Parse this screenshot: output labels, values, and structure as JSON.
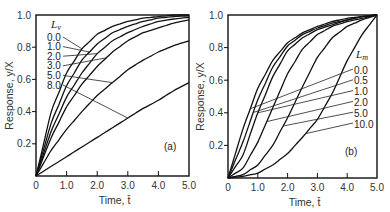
{
  "chart_data": [
    {
      "type": "line",
      "panel_label": "(a)",
      "title": "",
      "xlabel": "Time, t̄",
      "ylabel": "Response, y/X",
      "xlim": [
        0,
        5
      ],
      "ylim": [
        0,
        1
      ],
      "xticks": [
        1.0,
        2.0,
        3.0,
        4.0
      ],
      "xtick_labels": [
        "0",
        "1.0",
        "2.0",
        "3.0",
        "4.0",
        "5.0"
      ],
      "ytick_labels": [
        "0.2",
        "0.4",
        "0.6",
        "0.8",
        "1.0"
      ],
      "yticks": [
        0.2,
        0.4,
        0.6,
        0.8,
        1.0
      ],
      "grid": false,
      "legend_title": "L",
      "legend_title_sub": "v",
      "legend_position": "top-left",
      "x": [
        0,
        0.5,
        1,
        1.5,
        2,
        2.5,
        3,
        3.5,
        4,
        4.5,
        5
      ],
      "series": [
        {
          "name": "0.0",
          "values": [
            0,
            0.4,
            0.64,
            0.79,
            0.88,
            0.93,
            0.96,
            0.98,
            0.99,
            1.0,
            1.0
          ],
          "label_at": 1.5
        },
        {
          "name": "1.0",
          "values": [
            0,
            0.33,
            0.56,
            0.72,
            0.82,
            0.89,
            0.93,
            0.96,
            0.98,
            0.99,
            0.995
          ],
          "label_at": 1.75
        },
        {
          "name": "2.0",
          "values": [
            0,
            0.28,
            0.49,
            0.64,
            0.76,
            0.84,
            0.89,
            0.93,
            0.96,
            0.975,
            0.985
          ],
          "label_at": 2.0
        },
        {
          "name": "3.0",
          "values": [
            0,
            0.24,
            0.43,
            0.57,
            0.68,
            0.77,
            0.84,
            0.89,
            0.92,
            0.95,
            0.97
          ],
          "label_at": 2.3
        },
        {
          "name": "5.0",
          "values": [
            0,
            0.16,
            0.29,
            0.4,
            0.5,
            0.58,
            0.66,
            0.72,
            0.77,
            0.81,
            0.84
          ],
          "label_at": 2.5
        },
        {
          "name": "8.0",
          "values": [
            0,
            0.06,
            0.12,
            0.18,
            0.24,
            0.3,
            0.36,
            0.42,
            0.47,
            0.53,
            0.58
          ],
          "label_at": 3.0
        }
      ]
    },
    {
      "type": "line",
      "panel_label": "(b)",
      "title": "",
      "xlabel": "Time, t̄",
      "ylabel": "Response, y/X",
      "xlim": [
        0,
        5
      ],
      "ylim": [
        0,
        1
      ],
      "xticks": [
        1.0,
        2.0,
        3.0,
        4.0
      ],
      "xtick_labels": [
        "0",
        "1.0",
        "2.0",
        "3.0",
        "4.0",
        "5.0"
      ],
      "ytick_labels": [
        "0.2",
        "0.4",
        "0.6",
        "0.8",
        "1.0"
      ],
      "yticks": [
        0.2,
        0.4,
        0.6,
        0.8,
        1.0
      ],
      "grid": false,
      "legend_title": "L",
      "legend_title_sub": "m",
      "legend_position": "right",
      "x": [
        0,
        0.5,
        1,
        1.5,
        2,
        2.5,
        3,
        3.5,
        4,
        4.5,
        5
      ],
      "series": [
        {
          "name": "0.0",
          "values": [
            0,
            0.3,
            0.55,
            0.72,
            0.83,
            0.89,
            0.93,
            0.96,
            0.98,
            0.99,
            1.0
          ],
          "label_at": 0.75
        },
        {
          "name": "0.5",
          "values": [
            0,
            0.22,
            0.48,
            0.68,
            0.81,
            0.88,
            0.92,
            0.95,
            0.97,
            0.99,
            1.0
          ],
          "label_at": 0.85
        },
        {
          "name": "1.0",
          "values": [
            0,
            0.14,
            0.4,
            0.62,
            0.78,
            0.86,
            0.91,
            0.94,
            0.97,
            0.99,
            1.0
          ],
          "label_at": 1.0
        },
        {
          "name": "2.0",
          "values": [
            0,
            0.06,
            0.22,
            0.43,
            0.64,
            0.79,
            0.88,
            0.93,
            0.96,
            0.98,
            1.0
          ],
          "label_at": 1.3
        },
        {
          "name": "5.0",
          "values": [
            0,
            0.02,
            0.08,
            0.2,
            0.37,
            0.56,
            0.74,
            0.86,
            0.93,
            0.97,
            1.0
          ],
          "label_at": 1.85
        },
        {
          "name": "10.0",
          "values": [
            0,
            0.01,
            0.03,
            0.08,
            0.15,
            0.25,
            0.36,
            0.52,
            0.72,
            0.88,
            1.0
          ],
          "label_at": 2.6
        }
      ]
    }
  ]
}
